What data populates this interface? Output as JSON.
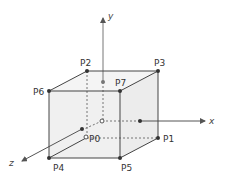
{
  "diagram": {
    "title": "",
    "colors": {
      "line": "#444444",
      "axis": "#666666",
      "face": "#f0f0f0",
      "dot": "#333333"
    },
    "axes": {
      "x_label": "x",
      "y_label": "y",
      "z_label": "z"
    },
    "vertices": [
      {
        "id": "P0",
        "label": "P0"
      },
      {
        "id": "P1",
        "label": "P1"
      },
      {
        "id": "P2",
        "label": "P2"
      },
      {
        "id": "P3",
        "label": "P3"
      },
      {
        "id": "P4",
        "label": "P4"
      },
      {
        "id": "P5",
        "label": "P5"
      },
      {
        "id": "P6",
        "label": "P6"
      },
      {
        "id": "P7",
        "label": "P7"
      }
    ]
  }
}
